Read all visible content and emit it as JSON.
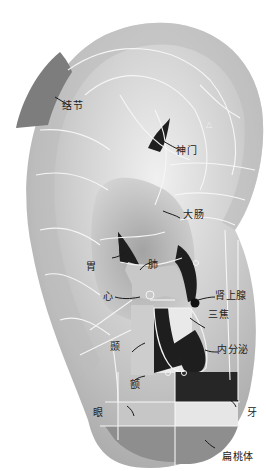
{
  "diagram": {
    "type": "auricular-acupoint-map",
    "colors": {
      "ear_light": "#e4e4e4",
      "ear_mid": "#b9b9b9",
      "ear_dark": "#7a7a7a",
      "zone_dark": "#2a2a2a",
      "zone_gray": "#8a8a8a",
      "zone_light": "#c9c9c9",
      "zone_pale": "#e6e6e6",
      "grid_line": "#f4f4f4"
    },
    "labels": {
      "jiejie": "结节",
      "shenmen": "神门",
      "triangle": "△",
      "dachang": "大肠",
      "wei": "胃",
      "fei": "肺",
      "xin": "心",
      "shenshangxian": "肾上腺",
      "sanjiao": "三焦",
      "nie": "颞",
      "neifenmi": "内分泌",
      "e": "额",
      "yan": "眼",
      "ya": "牙",
      "biantaoti": "扁桃体"
    }
  }
}
